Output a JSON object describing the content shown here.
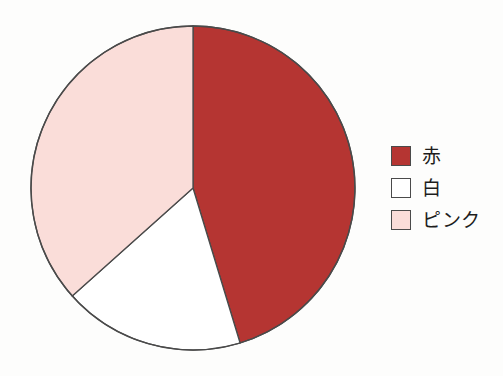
{
  "chart_data": {
    "type": "pie",
    "title": "",
    "subtitle": "",
    "xlabel": "",
    "ylabel": "",
    "grid": false,
    "legend_position": "right",
    "start_angle_deg": 0,
    "direction": "clockwise",
    "categories": [
      "赤",
      "白",
      "ピンク"
    ],
    "values": [
      45.3,
      18.1,
      36.6
    ],
    "slices": [
      {
        "label": "赤",
        "value": 45.3,
        "start_angle_deg": 0,
        "end_angle_deg": 163.1,
        "color": "#b53532"
      },
      {
        "label": "白",
        "value": 18.1,
        "start_angle_deg": 163.1,
        "end_angle_deg": 228.2,
        "color": "#ffffff"
      },
      {
        "label": "ピンク",
        "value": 36.6,
        "start_angle_deg": 228.2,
        "end_angle_deg": 360,
        "color": "#faddd9"
      }
    ],
    "annotations": []
  },
  "legend": {
    "items": [
      {
        "label": "赤",
        "color": "#b53532",
        "swatch_name": "legend-swatch-red"
      },
      {
        "label": "白",
        "color": "#ffffff",
        "swatch_name": "legend-swatch-white"
      },
      {
        "label": "ピンク",
        "color": "#faddd9",
        "swatch_name": "legend-swatch-pink"
      }
    ]
  },
  "style": {
    "background": "#fdfdfc",
    "outline_color": "#4a4a4a",
    "text_color": "#1d1d1d",
    "center_x": 193,
    "center_y": 188,
    "radius": 162
  }
}
